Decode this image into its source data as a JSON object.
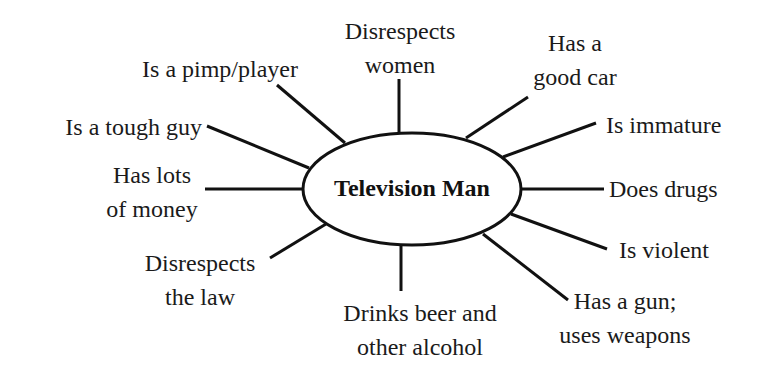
{
  "diagram": {
    "type": "concept-map",
    "center": {
      "label": "Television Man"
    },
    "colors": {
      "line": "#111111",
      "text": "#1a1a1a",
      "background": "#ffffff"
    },
    "nodes": [
      {
        "id": "women",
        "lines": [
          "Disrespects",
          "women"
        ]
      },
      {
        "id": "car",
        "lines": [
          "Has a",
          "good car"
        ]
      },
      {
        "id": "immature",
        "lines": [
          "Is immature"
        ]
      },
      {
        "id": "drugs",
        "lines": [
          "Does drugs"
        ]
      },
      {
        "id": "violent",
        "lines": [
          "Is violent"
        ]
      },
      {
        "id": "gun",
        "lines": [
          "Has a gun;",
          "uses weapons"
        ]
      },
      {
        "id": "beer",
        "lines": [
          "Drinks beer and",
          "other alcohol"
        ]
      },
      {
        "id": "law",
        "lines": [
          "Disrespects",
          "the law"
        ]
      },
      {
        "id": "money",
        "lines": [
          "Has lots",
          "of money"
        ]
      },
      {
        "id": "tough",
        "lines": [
          "Is a tough guy"
        ]
      },
      {
        "id": "pimp",
        "lines": [
          "Is a pimp/player"
        ]
      }
    ]
  }
}
